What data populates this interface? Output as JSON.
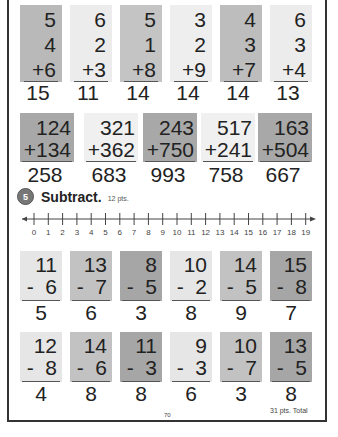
{
  "add_columns": [
    {
      "a": "5",
      "b": "4",
      "c": "+6",
      "answer": "15",
      "shade": "#b9b9b9"
    },
    {
      "a": "6",
      "b": "2",
      "c": "+3",
      "answer": "11",
      "shade": "#ececec"
    },
    {
      "a": "5",
      "b": "1",
      "c": "+8",
      "answer": "14",
      "shade": "#c4c4c4"
    },
    {
      "a": "3",
      "b": "2",
      "c": "+9",
      "answer": "14",
      "shade": "#eeeeee"
    },
    {
      "a": "4",
      "b": "3",
      "c": "+7",
      "answer": "14",
      "shade": "#bdbdbd"
    },
    {
      "a": "6",
      "b": "3",
      "c": "+4",
      "answer": "13",
      "shade": "#ececec"
    }
  ],
  "add_3digit": [
    {
      "a": "124",
      "b": "+134",
      "answer": "258",
      "shade": "#a8a8a8"
    },
    {
      "a": "321",
      "b": "+362",
      "answer": "683",
      "shade": "#f0f0f0"
    },
    {
      "a": "243",
      "b": "+750",
      "answer": "993",
      "shade": "#a8a8a8"
    },
    {
      "a": "517",
      "b": "+241",
      "answer": "758",
      "shade": "#f0f0f0"
    },
    {
      "a": "163",
      "b": "+504",
      "answer": "667",
      "shade": "#a8a8a8"
    }
  ],
  "section": {
    "number": "5",
    "title": "Subtract.",
    "points": "12 pts."
  },
  "number_line": {
    "labels": [
      "0",
      "1",
      "2",
      "3",
      "4",
      "5",
      "6",
      "7",
      "8",
      "9",
      "10",
      "11",
      "12",
      "13",
      "14",
      "15",
      "16",
      "17",
      "18",
      "19"
    ]
  },
  "subtract_row1": [
    {
      "a": "11",
      "b": "-  6",
      "answer": "5",
      "shade": "#e6e6e6"
    },
    {
      "a": "13",
      "b": "-  7",
      "answer": "6",
      "shade": "#c2c2c2"
    },
    {
      "a": "8",
      "b": "-  5",
      "answer": "3",
      "shade": "#a6a6a6"
    },
    {
      "a": "10",
      "b": "-  2",
      "answer": "8",
      "shade": "#e6e6e6"
    },
    {
      "a": "14",
      "b": "-  5",
      "answer": "9",
      "shade": "#c2c2c2"
    },
    {
      "a": "15",
      "b": "-  8",
      "answer": "7",
      "shade": "#a6a6a6"
    }
  ],
  "subtract_row2": [
    {
      "a": "12",
      "b": "-  8",
      "answer": "4",
      "shade": "#e6e6e6"
    },
    {
      "a": "14",
      "b": "-  6",
      "answer": "8",
      "shade": "#c2c2c2"
    },
    {
      "a": "11",
      "b": "-  3",
      "answer": "8",
      "shade": "#a6a6a6"
    },
    {
      "a": "9",
      "b": "-  3",
      "answer": "6",
      "shade": "#e6e6e6"
    },
    {
      "a": "10",
      "b": "-  7",
      "answer": "3",
      "shade": "#c2c2c2"
    },
    {
      "a": "13",
      "b": "-  5",
      "answer": "8",
      "shade": "#a6a6a6"
    }
  ],
  "footer": {
    "page_number": "70",
    "total": "31 pts. Total"
  }
}
